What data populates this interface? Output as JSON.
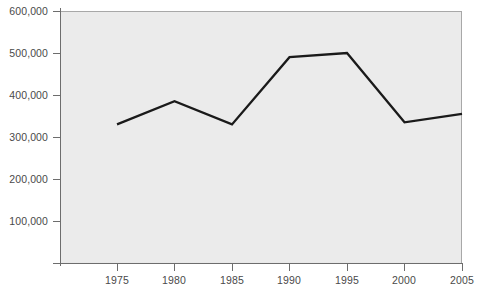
{
  "chart_data": {
    "type": "line",
    "title": "",
    "subtitle": "",
    "xlabel": "",
    "ylabel": "",
    "x": [
      1975,
      1980,
      1985,
      1990,
      1995,
      2000,
      2005
    ],
    "categories": [
      "1975",
      "1980",
      "1985",
      "1990",
      "1995",
      "2000",
      "2005"
    ],
    "values": [
      330000,
      385000,
      330000,
      490000,
      500000,
      335000,
      355000
    ],
    "series": [
      {
        "name": "",
        "values": [
          330000,
          385000,
          330000,
          490000,
          500000,
          335000,
          355000
        ],
        "color": "#1a1a1a"
      }
    ],
    "xlim": [
      1972.5,
      2005
    ],
    "ylim": [
      0,
      600000
    ],
    "x_tick_labels": [
      "1975",
      "1980",
      "1985",
      "1990",
      "1995",
      "2000",
      "2005"
    ],
    "y_tick_values": [
      100000,
      200000,
      300000,
      400000,
      500000,
      600000
    ],
    "y_tick_labels": [
      "100,000",
      "200,000",
      "300,000",
      "400,000",
      "500,000",
      "600,000"
    ],
    "grid": false,
    "legend": false,
    "legend_position": "none",
    "annotations": [],
    "plot_background_color": "#ebebeb",
    "axis_color": "#6d6d6d",
    "line_color": "#1a1a1a",
    "figure_background_color": "#ffffff"
  }
}
